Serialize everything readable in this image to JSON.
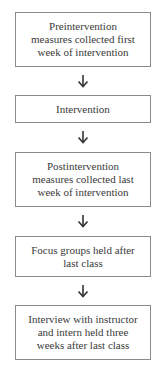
{
  "flowchart": {
    "steps": [
      {
        "label": "Preintervention measures collected first week of intervention",
        "lines": [
          "Preintervention",
          "measures collected first",
          "week of intervention"
        ]
      },
      {
        "label": "Intervention",
        "lines": [
          "Intervention"
        ]
      },
      {
        "label": "Postintervention measures collected last week of intervention",
        "lines": [
          "Postintervention",
          "measures collected last",
          "week of intervention"
        ]
      },
      {
        "label": "Focus groups held after last class",
        "lines": [
          "Focus groups held after",
          "last class"
        ]
      },
      {
        "label": "Interview with instructor and intern held three weeks after last class",
        "lines": [
          "Interview with instructor",
          "and intern held three",
          "weeks after last class"
        ]
      }
    ],
    "connector": "down-arrow",
    "colors": {
      "border": "#8a8a8a",
      "text": "#3a3a3a",
      "arrow": "#333333",
      "background": "#ffffff"
    }
  }
}
